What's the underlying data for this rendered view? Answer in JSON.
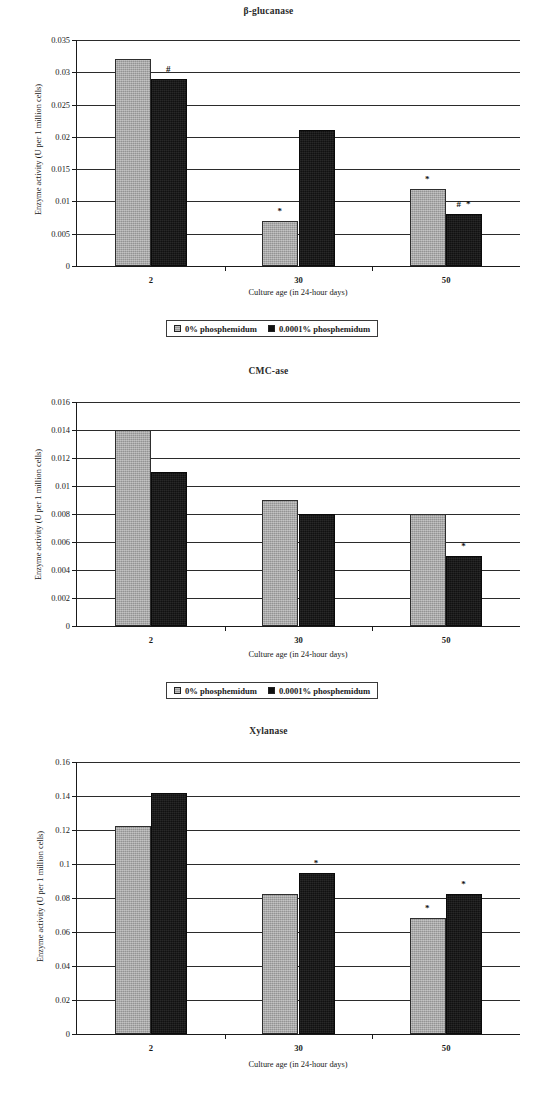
{
  "figure": {
    "axis_titles": {
      "y": "Enzyme activity (U per 1 million cells)",
      "x": "Culture age (in 24-hour days)"
    },
    "legend": {
      "series_0_label": "0% phosphemidum",
      "series_1_label": "0.0001% phosphemidum",
      "series_0_color": "#a5a5a5",
      "series_1_color": "#111111"
    }
  },
  "chart_data": [
    {
      "type": "bar",
      "title": "β-glucanase",
      "categories": [
        "2",
        "30",
        "50"
      ],
      "xlabel": "Culture age (in 24-hour days)",
      "ylabel": "Enzyme activity (U per 1 million cells)",
      "ylim": [
        0,
        0.035
      ],
      "ytick_step": 0.005,
      "yticks": [
        "0",
        "0.005",
        "0.01",
        "0.015",
        "0.02",
        "0.025",
        "0.03",
        "0.035"
      ],
      "grid": true,
      "legend_position": "below",
      "series": [
        {
          "name": "0% phosphemidum",
          "color": "#a5a5a5",
          "values": [
            0.032,
            0.007,
            0.012
          ],
          "annotations": [
            "",
            "*",
            "*"
          ]
        },
        {
          "name": "0.0001% phosphemidum",
          "color": "#111111",
          "values": [
            0.029,
            0.021,
            0.008
          ],
          "annotations": [
            "#",
            "",
            "# *"
          ]
        }
      ]
    },
    {
      "type": "bar",
      "title": "CMC-ase",
      "categories": [
        "2",
        "30",
        "50"
      ],
      "xlabel": "Culture age (in 24-hour days)",
      "ylabel": "Enzyme activity (U per 1 million cells)",
      "ylim": [
        0,
        0.016
      ],
      "ytick_step": 0.002,
      "yticks": [
        "0",
        "0.002",
        "0.004",
        "0.006",
        "0.008",
        "0.01",
        "0.012",
        "0.014",
        "0.016"
      ],
      "grid": true,
      "legend_position": "below",
      "series": [
        {
          "name": "0% phosphemidum",
          "color": "#a5a5a5",
          "values": [
            0.014,
            0.009,
            0.008
          ],
          "annotations": [
            "",
            "",
            ""
          ]
        },
        {
          "name": "0.0001% phosphemidum",
          "color": "#111111",
          "values": [
            0.011,
            0.008,
            0.005
          ],
          "annotations": [
            "",
            "",
            "*"
          ]
        }
      ]
    },
    {
      "type": "bar",
      "title": "Xylanase",
      "categories": [
        "2",
        "30",
        "50"
      ],
      "xlabel": "Culture age (in 24-hour days)",
      "ylabel": "Enzyme activity (U per 1 million cells)",
      "ylim": [
        0,
        0.16
      ],
      "ytick_step": 0.02,
      "yticks": [
        "0",
        "0.02",
        "0.04",
        "0.06",
        "0.08",
        "0.1",
        "0.12",
        "0.14",
        "0.16"
      ],
      "grid": true,
      "legend_position": "none",
      "series": [
        {
          "name": "0% phosphemidum",
          "color": "#a5a5a5",
          "values": [
            0.1225,
            0.0825,
            0.0685
          ],
          "annotations": [
            "",
            "",
            "*"
          ]
        },
        {
          "name": "0.0001% phosphemidum",
          "color": "#111111",
          "values": [
            0.1415,
            0.0945,
            0.0825
          ],
          "annotations": [
            "",
            "*",
            "*"
          ]
        }
      ]
    }
  ]
}
